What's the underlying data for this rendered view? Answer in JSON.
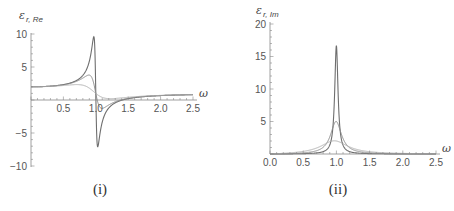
{
  "colors": {
    "axis": "#888888",
    "series": [
      "#6e6e6e",
      "#8a8a8a",
      "#b0b0b0"
    ]
  },
  "captions": {
    "left": "(i)",
    "right": "(ii)"
  },
  "chart_data": [
    {
      "type": "line",
      "title": "(i)",
      "xlabel": "ω",
      "ylabel": "ε_{r, Re}",
      "ylabel_main": "ε",
      "ylabel_sub": "r, Re",
      "xlim": [
        0,
        2.5
      ],
      "ylim": [
        -10,
        10
      ],
      "xticks": [
        0.5,
        1.0,
        1.5,
        2.0,
        2.5
      ],
      "xtick_labels": [
        "0.5",
        "1.0",
        "1.5",
        "2.0",
        "2.5"
      ],
      "yticks": [
        -10,
        -5,
        5,
        10
      ],
      "ytick_labels": [
        "−10",
        "−5",
        "5",
        "10"
      ],
      "grid": false,
      "legend": null,
      "model": "Lorentz oscillator: eps = 1 + 1/(1 - w^2 - i*g*w), real part",
      "x": [
        0.0,
        0.25,
        0.5,
        0.75,
        0.9,
        0.95,
        0.97,
        1.0,
        1.03,
        1.05,
        1.1,
        1.25,
        1.5,
        2.0,
        2.5
      ],
      "series": [
        {
          "name": "gamma=0.06",
          "values": [
            2.0,
            2.07,
            2.33,
            3.27,
            5.97,
            8.9,
            9.1,
            1.0,
            -7.0,
            -5.9,
            -3.6,
            -0.76,
            0.2,
            0.67,
            0.81
          ]
        },
        {
          "name": "gamma=0.2",
          "values": [
            2.0,
            2.06,
            2.31,
            3.0,
            3.52,
            3.29,
            2.99,
            1.0,
            -0.62,
            -0.22,
            -0.33,
            0.33,
            0.38,
            0.66,
            0.81
          ]
        },
        {
          "name": "gamma=0.5",
          "values": [
            2.0,
            2.04,
            2.21,
            2.28,
            1.71,
            1.39,
            1.24,
            1.0,
            0.77,
            0.66,
            0.61,
            0.6,
            0.62,
            0.68,
            0.81
          ]
        }
      ]
    },
    {
      "type": "line",
      "title": "(ii)",
      "xlabel": "ω",
      "ylabel": "ε_{r, Im}",
      "ylabel_main": "ε",
      "ylabel_sub": "r, Im",
      "xlim": [
        0,
        2.5
      ],
      "ylim": [
        0,
        20
      ],
      "xticks": [
        0.0,
        0.5,
        1.0,
        1.5,
        2.0,
        2.5
      ],
      "xtick_labels": [
        "0.0",
        "0.5",
        "1.0",
        "1.5",
        "2.0",
        "2.5"
      ],
      "yticks": [
        5,
        10,
        15,
        20
      ],
      "ytick_labels": [
        "5",
        "10",
        "15",
        "20"
      ],
      "grid": false,
      "legend": null,
      "model": "Lorentz oscillator: eps = 1 + 1/(1 - w^2 - i*g*w), imaginary part",
      "x": [
        0.0,
        0.25,
        0.5,
        0.75,
        0.9,
        0.95,
        1.0,
        1.05,
        1.1,
        1.25,
        1.5,
        2.0,
        2.5
      ],
      "series": [
        {
          "name": "gamma=0.06",
          "values": [
            0.0,
            0.02,
            0.05,
            0.22,
            1.38,
            4.9,
            16.7,
            5.2,
            1.5,
            0.2,
            0.06,
            0.01,
            0.0
          ]
        },
        {
          "name": "gamma=0.2",
          "values": [
            0.0,
            0.05,
            0.17,
            0.63,
            2.66,
            4.1,
            5.0,
            4.0,
            2.6,
            0.74,
            0.21,
            0.04,
            0.02
          ]
        },
        {
          "name": "gamma=0.5",
          "values": [
            0.0,
            0.13,
            0.39,
            0.96,
            1.68,
            1.9,
            2.0,
            1.9,
            1.71,
            1.04,
            0.44,
            0.11,
            0.05
          ]
        }
      ],
      "peaks": {
        "gamma=0.06": 16.7,
        "gamma=0.2": 5.0,
        "gamma=0.5": 2.0
      }
    }
  ],
  "model_params": {
    "eps_inf": 1,
    "f": 1,
    "omega0": 1,
    "gammas": [
      0.06,
      0.2,
      0.5
    ]
  }
}
